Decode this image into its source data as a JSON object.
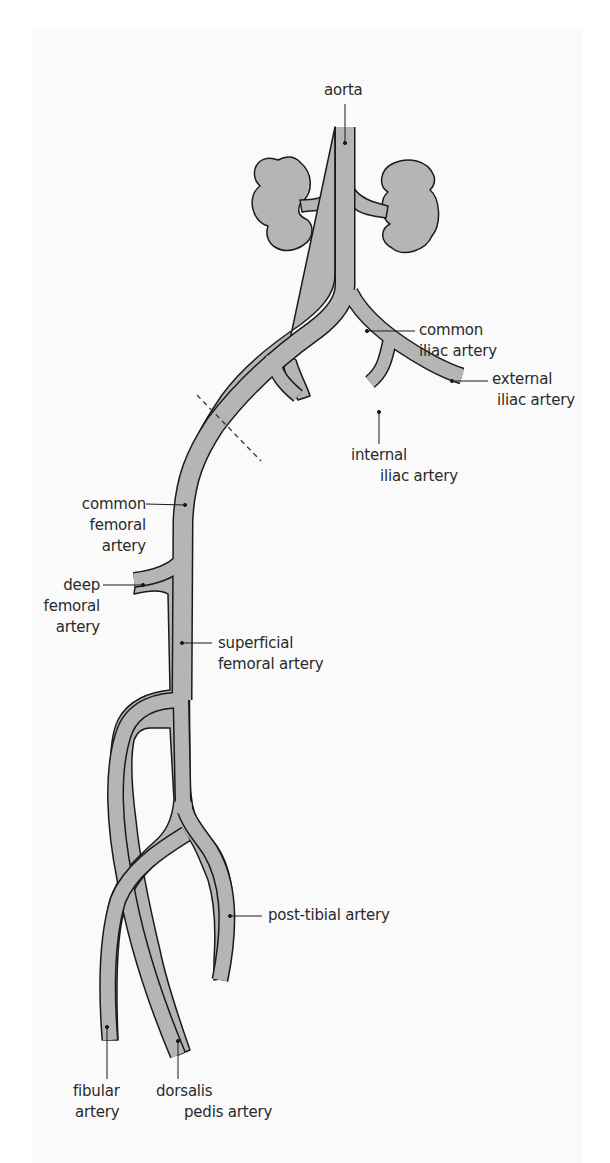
{
  "diagram": {
    "type": "anatomical arterial tree of the lower body (one leg)",
    "colors": {
      "vessel_fill": "#b5b5b5",
      "vessel_outline": "#1a1a1a",
      "label_text": "#2a2a2a",
      "background": "#fafafa"
    },
    "labels": {
      "aorta": {
        "line1": "aorta"
      },
      "common_iliac": {
        "line1": "common",
        "line2": "iliac artery"
      },
      "external_iliac": {
        "line1": "external",
        "line2": "iliac artery"
      },
      "internal_iliac": {
        "line1": "internal",
        "line2": "iliac artery"
      },
      "common_femoral": {
        "line1": "common",
        "line2": "femoral",
        "line3": "artery"
      },
      "deep_femoral": {
        "line1": "deep",
        "line2": "femoral",
        "line3": "artery"
      },
      "superficial_femoral": {
        "line1": "superficial",
        "line2": "femoral artery"
      },
      "post_tibial": {
        "line1": "post-tibial artery"
      },
      "fibular": {
        "line1": "fibular",
        "line2": "artery"
      },
      "dorsalis_pedis": {
        "line1": "dorsalis",
        "line2": "pedis artery"
      }
    },
    "structures": [
      "left kidney",
      "right kidney",
      "renal arteries",
      "dashed inguinal ligament line"
    ]
  }
}
